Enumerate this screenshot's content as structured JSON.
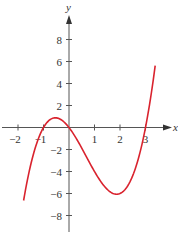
{
  "chart_data": {
    "type": "line",
    "title": "",
    "xlabel": "x",
    "ylabel": "y",
    "xlim": [
      -2.6,
      4.0
    ],
    "ylim": [
      -9.3,
      10.2
    ],
    "grid": false,
    "x_ticks": [
      -2,
      -1,
      1,
      2,
      3
    ],
    "x_tick_labels": [
      "−2",
      "−1",
      "1",
      "2",
      "3"
    ],
    "y_ticks": [
      8,
      6,
      4,
      2,
      -2,
      -4,
      -6,
      -8
    ],
    "y_tick_labels": [
      "8",
      "6",
      "4",
      "2",
      "−2",
      "−4",
      "−6",
      "−8"
    ],
    "series": [
      {
        "name": "f(x) = x^3 - 2x^2 - 3x",
        "color": "#d9232e",
        "x_range": [
          -1.78,
          3.38
        ],
        "x": [
          -1.78,
          -1.5,
          -1.0,
          -0.535,
          0,
          0.5,
          1.0,
          1.5,
          1.87,
          2.5,
          3.0,
          3.38
        ],
        "y": [
          -6.65,
          -3.38,
          0.0,
          0.88,
          0.0,
          -1.88,
          -4.0,
          -5.63,
          -6.06,
          -3.13,
          0.0,
          5.54
        ]
      }
    ],
    "colors": {
      "axis": "#555555",
      "curve": "#d9232e",
      "text": "#333333"
    }
  }
}
